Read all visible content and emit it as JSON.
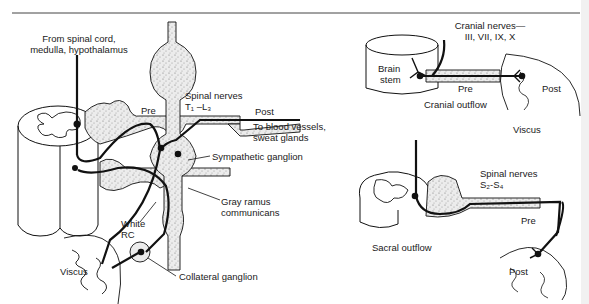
{
  "figure": {
    "type": "anatomical diagram",
    "colors": {
      "line": "#111111",
      "stipple_fill": "#d9d9d9",
      "background": "#ffffff",
      "rule": "#444444"
    }
  },
  "sympathetic_panel": {
    "labels": {
      "source_line1": "From spinal cord,",
      "source_line2": "medulla, hypothalamus",
      "pre": "Pre",
      "spinal_nerves_line1": "Spinal nerves",
      "spinal_nerves_line2": "T₁ –L₃",
      "post": "Post",
      "target_line1": "To blood vessels,",
      "target_line2": "sweat glands",
      "sympathetic_ganglion": "Sympathetic ganglion",
      "gray_ramus_line1": "Gray ramus",
      "gray_ramus_line2": "communicans",
      "white_rc_line1": "White",
      "white_rc_line2": "RC",
      "viscus": "Viscus",
      "collateral_ganglion": "Collateral ganglion"
    }
  },
  "cranial_panel": {
    "labels": {
      "cranial_nerves_line1": "Cranial nerves—",
      "cranial_nerves_line2": "III, VII, IX, X",
      "brain_stem_line1": "Brain",
      "brain_stem_line2": "stem",
      "pre": "Pre",
      "post": "Post",
      "outflow": "Cranial outflow",
      "viscus": "Viscus"
    }
  },
  "sacral_panel": {
    "labels": {
      "spinal_nerves_line1": "Spinal nerves",
      "spinal_nerves_line2": "S₂-S₄",
      "pre": "Pre",
      "outflow": "Sacral outflow",
      "post": "Post"
    }
  }
}
